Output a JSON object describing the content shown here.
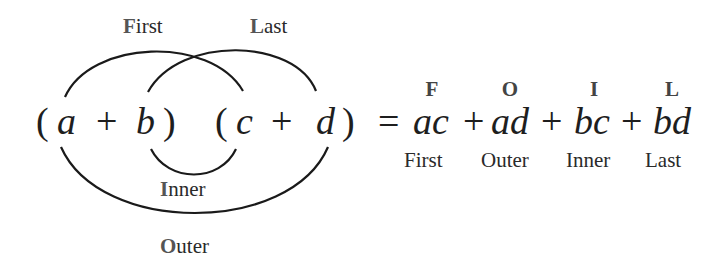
{
  "diagram": {
    "top_labels": {
      "first": {
        "cap": "F",
        "rest": "irst"
      },
      "last": {
        "cap": "L",
        "rest": "ast"
      }
    },
    "bottom_labels": {
      "inner": {
        "cap": "I",
        "rest": "nner"
      },
      "outer": {
        "cap": "O",
        "rest": "uter"
      }
    },
    "left_expression": {
      "open1": "(",
      "a": "a",
      "plus1": "+",
      "b": "b",
      "close1": ")",
      "open2": "(",
      "c": "c",
      "plus2": "+",
      "d": "d",
      "close2": ")"
    },
    "result": {
      "equals": "=",
      "terms": [
        {
          "letter": "F",
          "term": "ac",
          "label": "First"
        },
        {
          "letter": "O",
          "term": "ad",
          "label": "Outer"
        },
        {
          "letter": "I",
          "term": "bc",
          "label": "Inner"
        },
        {
          "letter": "L",
          "term": "bd",
          "label": "Last"
        }
      ],
      "plus": "+"
    },
    "arc_color": "#1a1a1a"
  }
}
